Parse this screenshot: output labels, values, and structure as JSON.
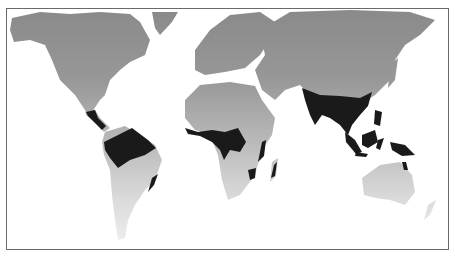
{
  "map": {
    "type": "world-map",
    "subject": "tropical rainforest distribution",
    "colors": {
      "land_top": "#8c8c8c",
      "land_bottom": "#e6e6e6",
      "rainforest": "#1a1a1a",
      "water": "#ffffff",
      "border": "#6a6a6a"
    },
    "regions": [
      {
        "name": "Central and South America rainforest"
      },
      {
        "name": "Atlantic Forest (Brazil coast)"
      },
      {
        "name": "West and Central Africa rainforest"
      },
      {
        "name": "East Africa coastal forest"
      },
      {
        "name": "Madagascar rainforest"
      },
      {
        "name": "South and Southeast Asia rainforest"
      },
      {
        "name": "Indonesia and New Guinea rainforest"
      },
      {
        "name": "Northeast Australia rainforest"
      }
    ]
  }
}
